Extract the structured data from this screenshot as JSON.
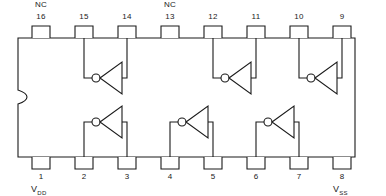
{
  "diagram": {
    "type": "ic-pinout",
    "package": "16-pin DIP",
    "stroke_color": "#1a1a1a",
    "background_color": "#ffffff",
    "body": {
      "x": 18,
      "y": 38,
      "width": 337,
      "height": 119,
      "notch": "left-edge-s-curve"
    },
    "pins_top": [
      {
        "number": "16",
        "x": 40,
        "label": "NC"
      },
      {
        "number": "15",
        "x": 83,
        "label": ""
      },
      {
        "number": "14",
        "x": 126,
        "label": ""
      },
      {
        "number": "13",
        "x": 169,
        "label": "NC"
      },
      {
        "number": "12",
        "x": 212,
        "label": ""
      },
      {
        "number": "11",
        "x": 255,
        "label": ""
      },
      {
        "number": "10",
        "x": 298,
        "label": ""
      },
      {
        "number": "9",
        "x": 341,
        "label": ""
      }
    ],
    "pins_bottom": [
      {
        "number": "1",
        "x": 40,
        "label": "VDD"
      },
      {
        "number": "2",
        "x": 83,
        "label": ""
      },
      {
        "number": "3",
        "x": 126,
        "label": ""
      },
      {
        "number": "4",
        "x": 169,
        "label": ""
      },
      {
        "number": "5",
        "x": 212,
        "label": ""
      },
      {
        "number": "6",
        "x": 255,
        "label": ""
      },
      {
        "number": "7",
        "x": 298,
        "label": ""
      },
      {
        "number": "8",
        "x": 341,
        "label": "VSS"
      }
    ],
    "gates": [
      {
        "id": "gate-top-1",
        "row": "top",
        "type": "inverter",
        "input_pin": "15",
        "output_pin": "14",
        "x": 83
      },
      {
        "id": "gate-top-2",
        "row": "top",
        "type": "inverter",
        "input_pin": "12",
        "output_pin": "11",
        "x": 212
      },
      {
        "id": "gate-top-3",
        "row": "top",
        "type": "inverter",
        "input_pin": "10",
        "output_pin": "9",
        "x": 298
      },
      {
        "id": "gate-bottom-1",
        "row": "bottom",
        "type": "inverter",
        "input_pin": "2",
        "output_pin": "3",
        "x": 83
      },
      {
        "id": "gate-bottom-2",
        "row": "bottom",
        "type": "inverter",
        "input_pin": "4",
        "output_pin": "5",
        "x": 169
      },
      {
        "id": "gate-bottom-3",
        "row": "bottom",
        "type": "inverter",
        "input_pin": "6",
        "output_pin": "7",
        "x": 255
      }
    ],
    "annotations": {
      "nc_left": "NC",
      "nc_mid": "NC",
      "vdd_main": "V",
      "vdd_sub": "DD",
      "vss_main": "V",
      "vss_sub": "SS"
    }
  }
}
